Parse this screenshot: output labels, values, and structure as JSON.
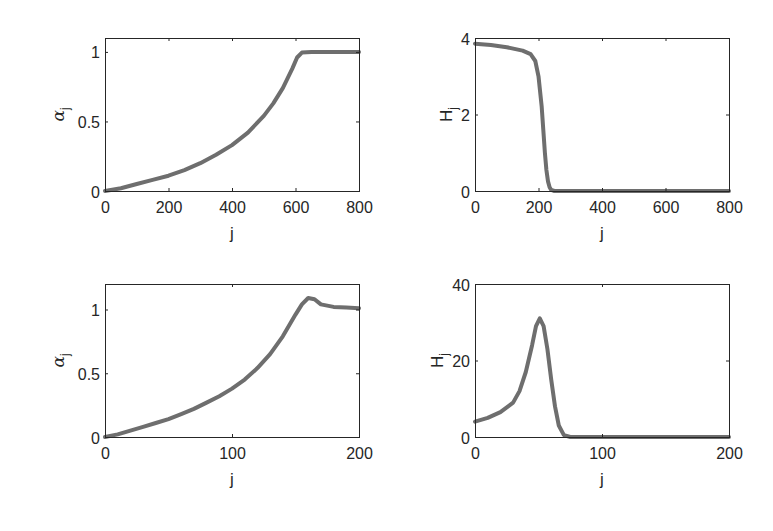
{
  "figure": {
    "line_color": "#6e6e6e",
    "axis_color": "#262626",
    "background": "#ffffff"
  },
  "chart_data": [
    {
      "id": "top-left",
      "type": "line",
      "title": "",
      "xlabel": "j",
      "ylabel": "α_j",
      "ylabel_main": "α",
      "ylabel_sub": "j",
      "xlim": [
        0,
        800
      ],
      "ylim": [
        0,
        1.1
      ],
      "xticks": [
        0,
        200,
        400,
        600,
        800
      ],
      "yticks": [
        0,
        0.5,
        1
      ],
      "ytick_labels": [
        "0",
        "0.5",
        "1"
      ],
      "grid": false,
      "box": {
        "x": 105,
        "y": 38,
        "w": 254,
        "h": 153
      },
      "series": [
        {
          "name": "alpha_j",
          "x": [
            0,
            50,
            100,
            150,
            200,
            250,
            300,
            350,
            400,
            450,
            500,
            530,
            560,
            590,
            605,
            620,
            650,
            700,
            750,
            800
          ],
          "y": [
            0,
            0.02,
            0.05,
            0.08,
            0.11,
            0.15,
            0.2,
            0.26,
            0.33,
            0.42,
            0.54,
            0.63,
            0.74,
            0.88,
            0.96,
            0.995,
            1.0,
            1.0,
            1.0,
            1.0
          ]
        }
      ]
    },
    {
      "id": "top-right",
      "type": "line",
      "title": "",
      "xlabel": "j",
      "ylabel": "H_j",
      "ylabel_main": "H",
      "ylabel_sub": "j",
      "xlim": [
        0,
        800
      ],
      "ylim": [
        0,
        4
      ],
      "xticks": [
        0,
        200,
        400,
        600,
        800
      ],
      "yticks": [
        0,
        2,
        4
      ],
      "ytick_labels": [
        "0",
        "2",
        "4"
      ],
      "grid": false,
      "box": {
        "x": 475,
        "y": 38,
        "w": 254,
        "h": 153
      },
      "series": [
        {
          "name": "H_j",
          "x": [
            0,
            50,
            100,
            150,
            175,
            190,
            200,
            210,
            215,
            220,
            225,
            230,
            235,
            240,
            250,
            300,
            400,
            500,
            600,
            700,
            800
          ],
          "y": [
            3.85,
            3.82,
            3.76,
            3.67,
            3.58,
            3.4,
            3.0,
            2.2,
            1.6,
            1.0,
            0.55,
            0.25,
            0.1,
            0.03,
            0.0,
            0.0,
            0.0,
            0.0,
            0.0,
            0.0,
            0.0
          ]
        }
      ]
    },
    {
      "id": "bottom-left",
      "type": "line",
      "title": "",
      "xlabel": "j",
      "ylabel": "α_j",
      "ylabel_main": "α",
      "ylabel_sub": "j",
      "xlim": [
        0,
        200
      ],
      "ylim": [
        0,
        1.2
      ],
      "xticks": [
        0,
        100,
        200
      ],
      "yticks": [
        0,
        0.5,
        1
      ],
      "ytick_labels": [
        "0",
        "0.5",
        "1"
      ],
      "grid": false,
      "box": {
        "x": 105,
        "y": 284,
        "w": 254,
        "h": 153
      },
      "series": [
        {
          "name": "alpha_j",
          "x": [
            0,
            10,
            20,
            30,
            40,
            50,
            60,
            70,
            80,
            90,
            100,
            110,
            120,
            130,
            140,
            150,
            155,
            160,
            165,
            170,
            180,
            190,
            200
          ],
          "y": [
            0,
            0.02,
            0.05,
            0.08,
            0.11,
            0.14,
            0.18,
            0.22,
            0.27,
            0.32,
            0.38,
            0.45,
            0.54,
            0.65,
            0.79,
            0.96,
            1.04,
            1.09,
            1.08,
            1.04,
            1.02,
            1.015,
            1.01
          ]
        }
      ]
    },
    {
      "id": "bottom-right",
      "type": "line",
      "title": "",
      "xlabel": "j",
      "ylabel": "H_j",
      "ylabel_main": "H",
      "ylabel_sub": "j",
      "xlim": [
        0,
        200
      ],
      "ylim": [
        0,
        40
      ],
      "xticks": [
        0,
        100,
        200
      ],
      "yticks": [
        0,
        20,
        40
      ],
      "ytick_labels": [
        "0",
        "20",
        "40"
      ],
      "grid": false,
      "box": {
        "x": 475,
        "y": 284,
        "w": 254,
        "h": 153
      },
      "series": [
        {
          "name": "H_j",
          "x": [
            0,
            10,
            20,
            30,
            35,
            40,
            45,
            48,
            51,
            54,
            57,
            60,
            63,
            66,
            70,
            75,
            80,
            100,
            150,
            200
          ],
          "y": [
            4,
            5,
            6.5,
            9,
            12,
            17,
            24,
            29,
            31,
            29,
            23,
            15,
            8,
            3,
            0.5,
            0,
            0,
            0,
            0,
            0
          ]
        }
      ]
    }
  ]
}
